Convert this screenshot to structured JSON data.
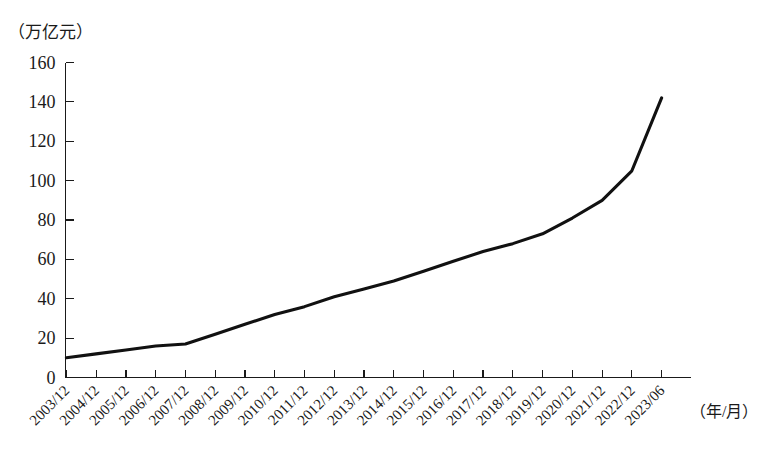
{
  "chart_data": {
    "type": "line",
    "title": "",
    "subtitle": "",
    "xlabel": "（年/月）",
    "ylabel": "（万亿元）",
    "ylim": [
      0,
      160
    ],
    "ytick_step": 20,
    "yticks": [
      0,
      20,
      40,
      60,
      80,
      100,
      120,
      140,
      160
    ],
    "grid": false,
    "legend": null,
    "line_color": "#111111",
    "categories": [
      "2003/12",
      "2004/12",
      "2005/12",
      "2006/12",
      "2007/12",
      "2008/12",
      "2009/12",
      "2010/12",
      "2011/12",
      "2012/12",
      "2013/12",
      "2014/12",
      "2015/12",
      "2016/12",
      "2017/12",
      "2018/12",
      "2019/12",
      "2020/12",
      "2021/12",
      "2022/12",
      "2023/06"
    ],
    "values": [
      10,
      12,
      14,
      16,
      17,
      22,
      27,
      32,
      36,
      41,
      45,
      49,
      54,
      59,
      64,
      68,
      73,
      81,
      90,
      105,
      142
    ],
    "series": [
      {
        "name": "",
        "values": [
          10,
          12,
          14,
          16,
          17,
          22,
          27,
          32,
          36,
          41,
          45,
          49,
          54,
          59,
          64,
          68,
          73,
          81,
          90,
          105,
          142
        ]
      }
    ],
    "annotations": []
  },
  "axes": {
    "y_unit_text": "（万亿元）",
    "x_unit_text": "（年/月）"
  }
}
